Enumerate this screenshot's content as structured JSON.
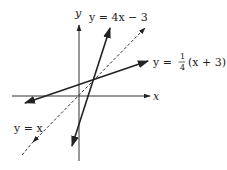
{
  "diagram": {
    "title": "",
    "axes": {
      "x_label": "x",
      "y_label": "y"
    },
    "lines": [
      {
        "id": "line-4x-minus-3",
        "label": "y = 4x − 3",
        "style": "solid",
        "color": "#222222"
      },
      {
        "id": "line-quarter-x-plus-3",
        "label_prefix": "y = ",
        "fraction_num": "1",
        "fraction_den": "4",
        "label_suffix": "(x + 3)",
        "style": "solid",
        "color": "#222222"
      },
      {
        "id": "line-identity",
        "label": "y = x",
        "style": "dashed",
        "color": "#222222"
      }
    ],
    "intersection": {
      "x": 1,
      "y": 1
    }
  }
}
